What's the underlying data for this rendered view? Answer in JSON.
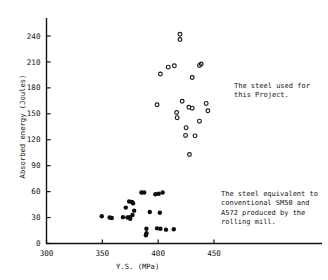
{
  "chart_data": {
    "type": "scatter",
    "title": "",
    "xlabel": "Y.S. (MPa)",
    "ylabel": "Absorbed energy (Joules)",
    "xlim": [
      300,
      470
    ],
    "ylim": [
      0,
      255
    ],
    "xticks": [
      300,
      350,
      400,
      450
    ],
    "yticks": [
      0,
      30,
      60,
      90,
      120,
      150,
      180,
      210,
      240
    ],
    "grid": false,
    "legend_position": "right-annotations",
    "series": [
      {
        "name": "The steel used for this Project.",
        "marker": "open-circle",
        "color": "#1a1a1a",
        "points": [
          [
            419.5,
            242.0
          ],
          [
            419.5,
            236.0
          ],
          [
            409.0,
            204.0
          ],
          [
            414.5,
            205.5
          ],
          [
            437.0,
            206.0
          ],
          [
            438.5,
            207.5
          ],
          [
            402.0,
            196.0
          ],
          [
            430.5,
            192.0
          ],
          [
            421.5,
            164.5
          ],
          [
            443.0,
            162.0
          ],
          [
            399.0,
            160.5
          ],
          [
            427.5,
            157.5
          ],
          [
            430.5,
            156.5
          ],
          [
            444.5,
            153.5
          ],
          [
            416.5,
            151.5
          ],
          [
            417.0,
            145.5
          ],
          [
            437.0,
            141.5
          ],
          [
            425.0,
            134.0
          ],
          [
            424.5,
            125.0
          ],
          [
            433.0,
            124.5
          ],
          [
            428.0,
            103.0
          ]
        ]
      },
      {
        "name": "The steel equivalent to conventional SM50 and A572 produced by the rolling mill.",
        "marker": "filled-circle",
        "color": "#0d0d0d",
        "points": [
          [
            385.0,
            59.0
          ],
          [
            387.5,
            59.0
          ],
          [
            404.0,
            59.0
          ],
          [
            397.5,
            57.0
          ],
          [
            400.5,
            57.5
          ],
          [
            374.0,
            48.5
          ],
          [
            376.5,
            48.0
          ],
          [
            377.5,
            46.5
          ],
          [
            371.0,
            41.5
          ],
          [
            378.5,
            38.0
          ],
          [
            392.5,
            36.5
          ],
          [
            401.5,
            35.5
          ],
          [
            349.5,
            31.5
          ],
          [
            356.5,
            30.0
          ],
          [
            358.5,
            29.5
          ],
          [
            368.5,
            30.5
          ],
          [
            372.5,
            30.0
          ],
          [
            374.5,
            30.5
          ],
          [
            375.0,
            28.5
          ],
          [
            377.0,
            33.0
          ],
          [
            389.5,
            17.0
          ],
          [
            389.5,
            12.0
          ],
          [
            389.0,
            9.5
          ],
          [
            399.0,
            17.5
          ],
          [
            402.0,
            17.0
          ],
          [
            407.0,
            16.0
          ],
          [
            414.0,
            16.5
          ]
        ]
      }
    ],
    "braces": [
      {
        "label": "upper-brace",
        "y_top": 198,
        "y_bottom": 88,
        "x": 212
      },
      {
        "label": "lower-brace",
        "y_top": 66,
        "y_bottom": 4,
        "x": 201
      }
    ]
  },
  "annotations": {
    "upper": "The steel used for\nthis Project.",
    "lower": "The steel equivalent to\nconventional SM50 and\nA572 produced by the\nrolling mill."
  },
  "axes": {
    "xlabel": "Y.S. (MPa)",
    "ylabel": "Absorbed energy (Joules)",
    "xticklabels": [
      "300",
      "350",
      "400",
      "450"
    ],
    "yticklabels": [
      "0",
      "30",
      "60",
      "90",
      "120",
      "150",
      "180",
      "210",
      "240"
    ]
  }
}
